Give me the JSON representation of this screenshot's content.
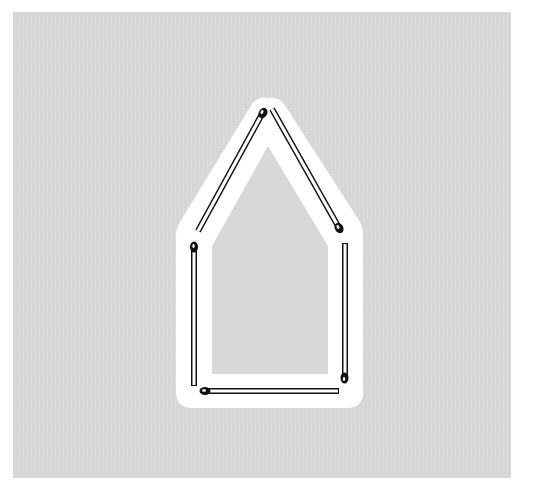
{
  "figure": {
    "caption": "",
    "shape": "house",
    "match_count": 6,
    "colors": {
      "page_background": "#ffffff",
      "panel_background": "#d8d8d8",
      "halo": "#ffffff",
      "match_outline": "#111111",
      "match_stick": "#ffffff",
      "match_head": "#111111"
    },
    "matches": [
      {
        "id": "roof-left",
        "head": [
          262,
          113
        ],
        "tail": [
          198,
          232
        ]
      },
      {
        "id": "roof-right",
        "head": [
          339,
          228
        ],
        "tail": [
          273,
          110
        ]
      },
      {
        "id": "wall-left",
        "head": [
          194,
          247
        ],
        "tail": [
          194,
          386
        ]
      },
      {
        "id": "wall-right",
        "head": [
          344,
          378
        ],
        "tail": [
          345,
          243
        ]
      },
      {
        "id": "floor",
        "head": [
          205,
          391
        ],
        "tail": [
          339,
          391
        ]
      }
    ]
  }
}
